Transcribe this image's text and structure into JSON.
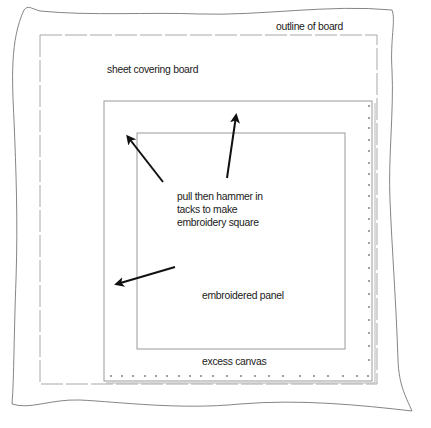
{
  "diagram": {
    "labels": {
      "outline_of_board": "outline of board",
      "sheet_covering_board": "sheet covering board",
      "instruction": {
        "line1": "pull then hammer in",
        "line2": "tacks to make",
        "line3": "embroidery square"
      },
      "embroidered_panel": "embroidered panel",
      "excess_canvas": "excess canvas"
    },
    "colors": {
      "background": "#ffffff",
      "line": "#9a9a9a",
      "outline": "#777777",
      "arrow": "#111111",
      "tack": "#8a8a8a",
      "text": "#1a1a1a"
    },
    "regions": [
      {
        "name": "outline of board",
        "style": "wavy freehand"
      },
      {
        "name": "sheet covering board",
        "style": "dashed rectangle"
      },
      {
        "name": "excess canvas",
        "style": "solid rectangle with tacks along right and bottom edges"
      },
      {
        "name": "embroidered panel",
        "style": "solid rectangle"
      }
    ],
    "arrows": [
      {
        "direction": "up-left",
        "from": [
          163,
          182
        ],
        "to": [
          125,
          133
        ]
      },
      {
        "direction": "up",
        "from": [
          227,
          178
        ],
        "to": [
          237,
          112
        ]
      },
      {
        "direction": "left",
        "from": [
          175,
          267
        ],
        "to": [
          113,
          285
        ]
      }
    ]
  }
}
